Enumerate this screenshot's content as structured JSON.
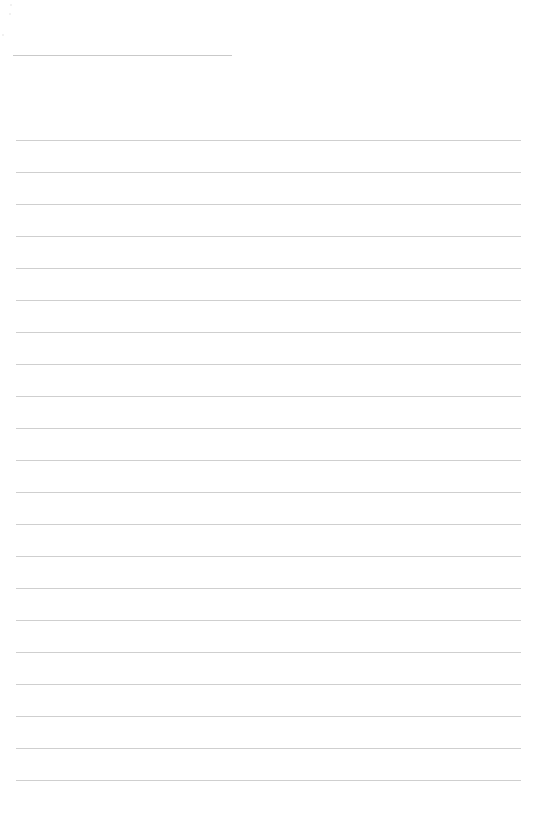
{
  "page": {
    "type": "lined-paper",
    "background": "#ffffff",
    "line_color": "#cfcfcf",
    "header_line": {
      "x": 13,
      "y": 55,
      "width": 219
    },
    "rules": {
      "count": 21,
      "first_y": 140,
      "spacing": 32,
      "x": 16,
      "width": 505
    }
  }
}
